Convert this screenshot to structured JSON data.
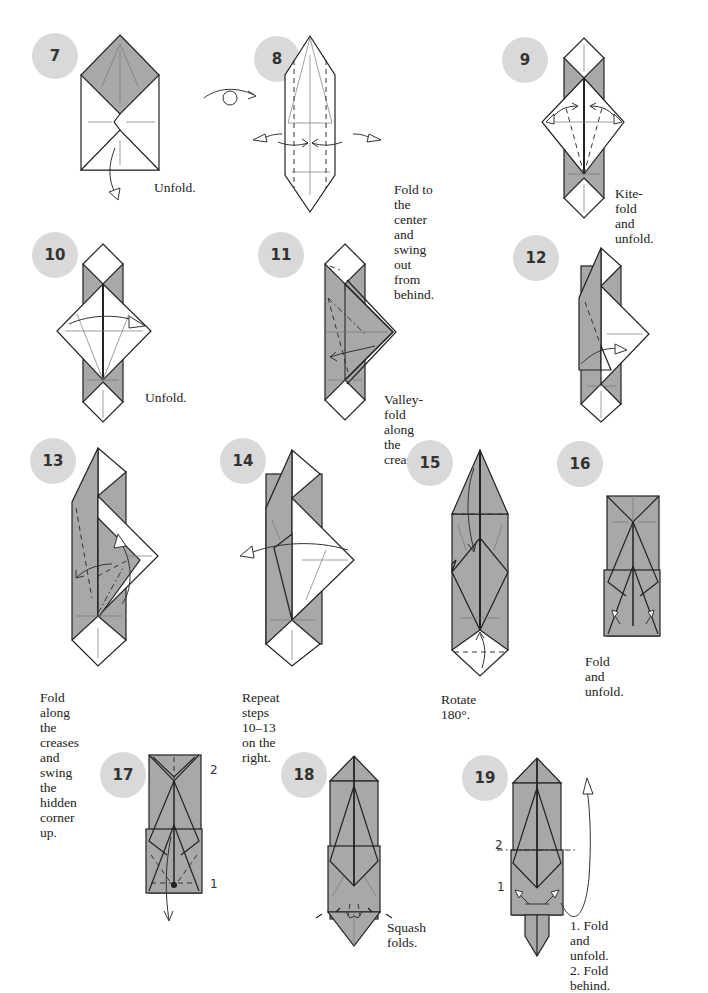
{
  "page": {
    "type": "origami-instructions",
    "colors": {
      "paper_color_side": "#a8a8a8",
      "paper_white_side": "#ffffff",
      "badge": "#d9d9d9",
      "line": "#222222"
    }
  },
  "steps": [
    {
      "number": "7",
      "caption": "Unfold.",
      "icons": [
        "unfold-arrow-icon"
      ]
    },
    {
      "number": "8",
      "caption": "Fold to the center\nand swing out\nfrom behind.",
      "icons": [
        "turn-over-icon",
        "swing-out-arrow-icon",
        "fold-to-center-arrow-icon"
      ]
    },
    {
      "number": "9",
      "caption": "Kite-fold\nand unfold.",
      "icons": [
        "fold-unfold-arrow-icon"
      ]
    },
    {
      "number": "10",
      "caption": "Unfold.",
      "icons": [
        "unfold-arrow-icon"
      ]
    },
    {
      "number": "11",
      "caption": "Valley-fold along\nthe creases.",
      "icons": [
        "valley-fold-arrow-icon"
      ]
    },
    {
      "number": "12",
      "caption": "",
      "icons": [
        "fold-arrow-icon"
      ]
    },
    {
      "number": "13",
      "caption": "Fold along the creases\nand swing the hidden\ncorner up.",
      "icons": [
        "fold-arrow-icon",
        "swing-arrow-icon"
      ]
    },
    {
      "number": "14",
      "caption": "Repeat steps 10–13\non the right.",
      "icons": [
        "unfold-arrow-icon"
      ]
    },
    {
      "number": "15",
      "caption": "Rotate 180°.",
      "icons": [
        "fold-arrow-icon"
      ]
    },
    {
      "number": "16",
      "caption": "Fold and unfold.",
      "icons": [
        "fold-unfold-arrow-icon"
      ]
    },
    {
      "number": "17",
      "caption": "",
      "markers": [
        "2",
        "1"
      ],
      "icons": [
        "fold-arrow-icon",
        "reference-dot-icon"
      ]
    },
    {
      "number": "18",
      "caption": "Squash folds.",
      "icons": [
        "squash-arrow-icon"
      ]
    },
    {
      "number": "19",
      "caption": "1. Fold and unfold.\n2. Fold behind.",
      "markers": [
        "2",
        "1"
      ],
      "icons": [
        "fold-behind-arrow-icon",
        "fold-unfold-arrow-icon"
      ]
    }
  ]
}
